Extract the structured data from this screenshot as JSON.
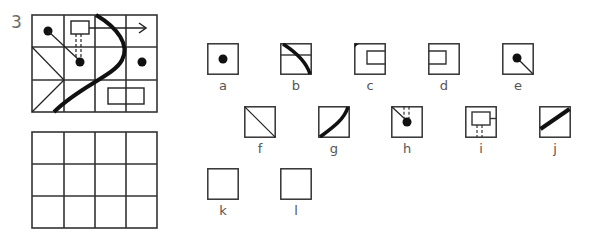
{
  "question": {
    "number": "3"
  },
  "puzzle_grid": {
    "rows": 3,
    "cols": 4,
    "elements": [
      "dot",
      "dot-connector-line",
      "rectangle",
      "dashed-double-line",
      "arrow-right",
      "thick-curve",
      "diagonal-lines",
      "dot",
      "wide-rectangle"
    ]
  },
  "answer_grid": {
    "rows": 3,
    "cols": 4,
    "state": "empty"
  },
  "options": [
    {
      "label": "a",
      "content": "dot"
    },
    {
      "label": "b",
      "content": "curve-with-horizontal-line"
    },
    {
      "label": "c",
      "content": "corner-mark-with-rectangle-right"
    },
    {
      "label": "d",
      "content": "rectangle-left"
    },
    {
      "label": "e",
      "content": "dot-with-diagonal-line"
    },
    {
      "label": "f",
      "content": "diagonal-line"
    },
    {
      "label": "g",
      "content": "thick-curve"
    },
    {
      "label": "h",
      "content": "dot-with-line-and-dashes"
    },
    {
      "label": "i",
      "content": "rectangle-with-stub-and-dashes"
    },
    {
      "label": "j",
      "content": "thick-diagonal"
    },
    {
      "label": "k",
      "content": "empty"
    },
    {
      "label": "l",
      "content": "empty"
    }
  ],
  "colors": {
    "stroke": "#222222",
    "grid": "#333333",
    "label": "#555555",
    "qnum": "#6b6b6b"
  }
}
